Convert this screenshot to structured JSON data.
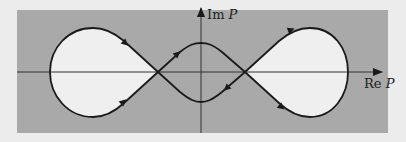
{
  "figure": {
    "background_color": "#ececec",
    "panel_color": "#a9a9a9",
    "lobe_fill_color": "#efefef",
    "curve_color": "#1a1a1a",
    "axis_color": "#333333"
  },
  "axes": {
    "x_label_prefix": "Re ",
    "x_label_var": "P",
    "y_label_prefix": "Im ",
    "y_label_var": "P"
  },
  "curve": {
    "description": "Closed contour forming two teardrop lobes joined by a central lens, crossing the real axis at two points",
    "arrow_count": 6
  }
}
